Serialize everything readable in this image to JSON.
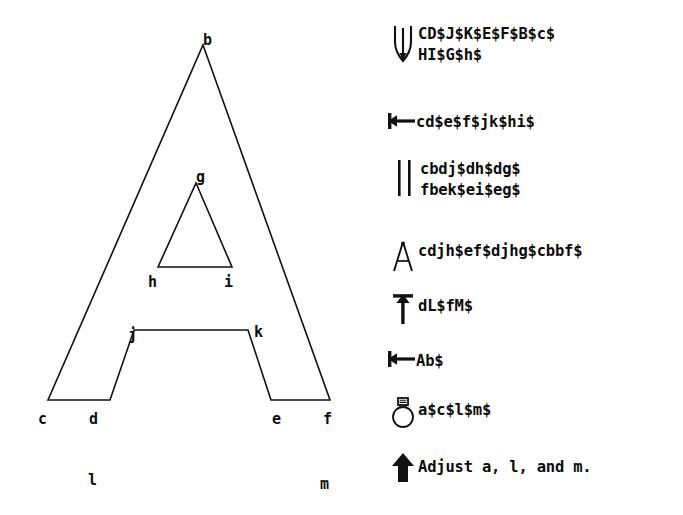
{
  "diagram": {
    "name": "letter-a-outline",
    "vertex_labels": [
      {
        "id": "b",
        "text": "b",
        "x": 203,
        "y": 33
      },
      {
        "id": "g",
        "text": "g",
        "x": 196,
        "y": 170
      },
      {
        "id": "h",
        "text": "h",
        "x": 148,
        "y": 275
      },
      {
        "id": "i",
        "text": "i",
        "x": 224,
        "y": 275
      },
      {
        "id": "j",
        "text": "j",
        "x": 128,
        "y": 328
      },
      {
        "id": "k",
        "text": "k",
        "x": 254,
        "y": 325
      },
      {
        "id": "c",
        "text": "c",
        "x": 38,
        "y": 412
      },
      {
        "id": "d",
        "text": "d",
        "x": 89,
        "y": 412
      },
      {
        "id": "e",
        "text": "e",
        "x": 272,
        "y": 412
      },
      {
        "id": "f",
        "text": "f",
        "x": 323,
        "y": 412
      },
      {
        "id": "l",
        "text": "l",
        "x": 88,
        "y": 473
      },
      {
        "id": "m",
        "text": "m",
        "x": 320,
        "y": 477
      }
    ],
    "stroke_color": "#111111",
    "fill_color": "#ffffff"
  },
  "legend": {
    "rows": [
      {
        "icon": "tuning-fork-icon",
        "text": "CD$J$K$E$F$B$c$\nHI$G$h$"
      },
      {
        "icon": "left-arrow-to-bar-icon",
        "text": "cd$e$f$jk$hi$"
      },
      {
        "icon": "parallel-lines-icon",
        "text": "cbdj$dh$dg$\nfbek$ei$eg$"
      },
      {
        "icon": "compass-divider-icon",
        "text": "cdjh$ef$djhg$cbbf$"
      },
      {
        "icon": "up-arrow-to-bar-icon",
        "text": "dL$fM$"
      },
      {
        "icon": "left-arrow-to-bar-icon",
        "text": "Ab$"
      },
      {
        "icon": "flask-balloon-icon",
        "text": "a$c$l$m$"
      },
      {
        "icon": "solid-up-arrow-icon",
        "text": "Adjust a, l, and m."
      }
    ]
  }
}
